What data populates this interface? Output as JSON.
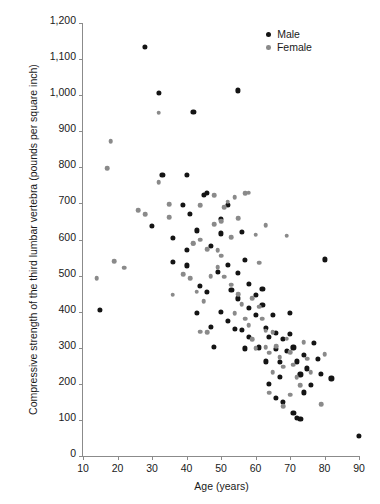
{
  "chart_data": {
    "type": "scatter",
    "title": "",
    "xlabel": "Age (years)",
    "ylabel": "Compressive strength of the third lumbar vertebra (pounds per square inch)",
    "xlim": [
      10,
      90
    ],
    "ylim": [
      0,
      1200
    ],
    "xticks": [
      10,
      20,
      30,
      40,
      50,
      60,
      70,
      80,
      90
    ],
    "xtick_labels": [
      "10",
      "20",
      "30",
      "40",
      "50",
      "60",
      "70",
      "80",
      "90"
    ],
    "yticks": [
      0,
      100,
      200,
      300,
      400,
      500,
      600,
      700,
      800,
      900,
      1000,
      1100,
      1200
    ],
    "ytick_labels": [
      "0",
      "100",
      "200",
      "300",
      "400",
      "500",
      "600",
      "700",
      "800",
      "900",
      "1,000",
      "1,100",
      "1,200"
    ],
    "grid": false,
    "legend_position": "top-right",
    "colors": {
      "male": "#141414",
      "female": "#8a8a8a",
      "axis": "#8b8b8b",
      "text": "#1a1a1a",
      "background": "#ffffff"
    },
    "series": [
      {
        "name": "Male",
        "marker": "filled-circle",
        "color": "#141414",
        "points": [
          [
            15,
            405
          ],
          [
            28,
            1133
          ],
          [
            32,
            1006
          ],
          [
            42,
            953
          ],
          [
            55,
            1013
          ],
          [
            33,
            778
          ],
          [
            40,
            778
          ],
          [
            30,
            637
          ],
          [
            39,
            696
          ],
          [
            41,
            672
          ],
          [
            43,
            625
          ],
          [
            36,
            604
          ],
          [
            40,
            572
          ],
          [
            46,
            729
          ],
          [
            50,
            658
          ],
          [
            52,
            696
          ],
          [
            50,
            617
          ],
          [
            45,
            723
          ],
          [
            36,
            537
          ],
          [
            40,
            528
          ],
          [
            47,
            582
          ],
          [
            49,
            510
          ],
          [
            44,
            472
          ],
          [
            46,
            455
          ],
          [
            52,
            530
          ],
          [
            55,
            508
          ],
          [
            57,
            543
          ],
          [
            53,
            461
          ],
          [
            55,
            437
          ],
          [
            50,
            399
          ],
          [
            52,
            375
          ],
          [
            56,
            349
          ],
          [
            58,
            478
          ],
          [
            58,
            411
          ],
          [
            60,
            446
          ],
          [
            60,
            390
          ],
          [
            62,
            462
          ],
          [
            62,
            418
          ],
          [
            63,
            355
          ],
          [
            64,
            331
          ],
          [
            58,
            331
          ],
          [
            57,
            298
          ],
          [
            61,
            301
          ],
          [
            63,
            262
          ],
          [
            65,
            392
          ],
          [
            66,
            342
          ],
          [
            66,
            296
          ],
          [
            67,
            261
          ],
          [
            68,
            325
          ],
          [
            69,
            292
          ],
          [
            70,
            396
          ],
          [
            70,
            338
          ],
          [
            71,
            301
          ],
          [
            72,
            262
          ],
          [
            73,
            226
          ],
          [
            74,
            281
          ],
          [
            75,
            243
          ],
          [
            76,
            198
          ],
          [
            64,
            199
          ],
          [
            66,
            160
          ],
          [
            68,
            151
          ],
          [
            71,
            120
          ],
          [
            72,
            105
          ],
          [
            73,
            102
          ],
          [
            77,
            314
          ],
          [
            78,
            269
          ],
          [
            79,
            228
          ],
          [
            80,
            545
          ],
          [
            82,
            215
          ],
          [
            90,
            55
          ],
          [
            47,
            357
          ],
          [
            54,
            353
          ],
          [
            48,
            302
          ],
          [
            43,
            396
          ],
          [
            56,
            621
          ],
          [
            67,
            220
          ],
          [
            74,
            176
          ]
        ]
      },
      {
        "name": "Female",
        "marker": "filled-circle",
        "color": "#8a8a8a",
        "points": [
          [
            18,
            873
          ],
          [
            17,
            797
          ],
          [
            14,
            493
          ],
          [
            19,
            540
          ],
          [
            22,
            522
          ],
          [
            32,
            951
          ],
          [
            32,
            759
          ],
          [
            26,
            682
          ],
          [
            28,
            670
          ],
          [
            35,
            697
          ],
          [
            35,
            662
          ],
          [
            42,
            590
          ],
          [
            44,
            695
          ],
          [
            48,
            642
          ],
          [
            48,
            722
          ],
          [
            50,
            651
          ],
          [
            51,
            690
          ],
          [
            52,
            705
          ],
          [
            54,
            718
          ],
          [
            55,
            659
          ],
          [
            57,
            729
          ],
          [
            58,
            730
          ],
          [
            44,
            600
          ],
          [
            46,
            573
          ],
          [
            49,
            570
          ],
          [
            53,
            607
          ],
          [
            60,
            613
          ],
          [
            63,
            640
          ],
          [
            69,
            611
          ],
          [
            39,
            504
          ],
          [
            41,
            492
          ],
          [
            43,
            455
          ],
          [
            47,
            498
          ],
          [
            49,
            523
          ],
          [
            51,
            497
          ],
          [
            53,
            475
          ],
          [
            55,
            449
          ],
          [
            56,
            420
          ],
          [
            54,
            395
          ],
          [
            57,
            380
          ],
          [
            58,
            363
          ],
          [
            59,
            437
          ],
          [
            61,
            414
          ],
          [
            62,
            380
          ],
          [
            63,
            347
          ],
          [
            59,
            324
          ],
          [
            60,
            298
          ],
          [
            44,
            345
          ],
          [
            46,
            343
          ],
          [
            63,
            302
          ],
          [
            64,
            286
          ],
          [
            65,
            343
          ],
          [
            66,
            305
          ],
          [
            67,
            274
          ],
          [
            68,
            247
          ],
          [
            69,
            325
          ],
          [
            70,
            288
          ],
          [
            71,
            253
          ],
          [
            72,
            219
          ],
          [
            73,
            196
          ],
          [
            74,
            316
          ],
          [
            75,
            270
          ],
          [
            76,
            232
          ],
          [
            64,
            175
          ],
          [
            68,
            138
          ],
          [
            70,
            170
          ],
          [
            79,
            144
          ],
          [
            80,
            282
          ],
          [
            42,
            588
          ],
          [
            45,
            429
          ],
          [
            50,
            555
          ],
          [
            36,
            447
          ],
          [
            61,
            536
          ],
          [
            65,
            232
          ]
        ]
      }
    ]
  },
  "legend": {
    "items": [
      {
        "label": "Male",
        "key": "male"
      },
      {
        "label": "Female",
        "key": "female"
      }
    ]
  }
}
